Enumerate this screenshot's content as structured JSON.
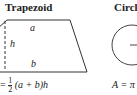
{
  "trapezoid": {
    "title": "Trapezoid",
    "label_top": "a",
    "label_height": "h",
    "label_bottom": "b",
    "formula_prefix": "=",
    "formula_fraction_num": "1",
    "formula_fraction_den": "2",
    "formula_rest": "(a + b)h"
  },
  "circle": {
    "title": "Circle",
    "formula": "A = π"
  }
}
